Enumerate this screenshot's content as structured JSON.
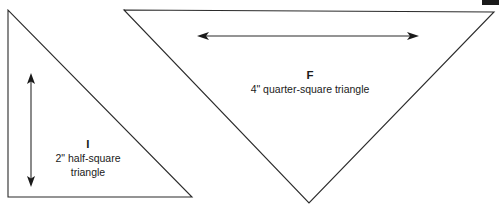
{
  "diagram": {
    "background_color": "#ffffff",
    "line_color": "#2b2b2b",
    "text_color": "#1a1a1a",
    "shapes": [
      {
        "key": "I",
        "name": "half-square-triangle",
        "label_key": "I",
        "label_desc_line1": "2\" half-square",
        "label_desc_line2": "triangle",
        "dimension": "2\"",
        "dimension_orientation": "vertical",
        "points": "8,10 8,197 192,197"
      },
      {
        "key": "F",
        "name": "quarter-square-triangle",
        "label_key": "F",
        "label_desc_line1": "4\" quarter-square triangle",
        "label_desc_line2": "",
        "dimension": "4\"",
        "dimension_orientation": "horizontal",
        "points": "124,10 494,12 309,203"
      }
    ],
    "dimension_arrows": [
      {
        "name": "vertical-dimension-arrow",
        "orientation": "vertical",
        "x1": 31,
        "y1": 74,
        "x2": 31,
        "y2": 186
      },
      {
        "name": "horizontal-dimension-arrow",
        "orientation": "horizontal",
        "x1": 198,
        "y1": 36,
        "x2": 418,
        "y2": 36
      }
    ]
  }
}
